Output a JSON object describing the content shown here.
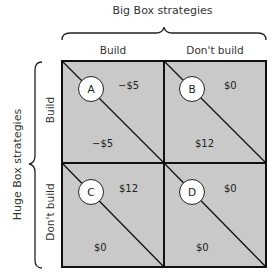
{
  "title_top": "Big Box strategies",
  "title_side": "Huge Box strategies",
  "columns": [
    "Build",
    "Don't build"
  ],
  "rows": [
    "Build",
    "Don't build"
  ],
  "cells": [
    {
      "id": "A",
      "top_right": "−$5",
      "bottom_left": "−$5"
    },
    {
      "id": "B",
      "top_right": "$0",
      "bottom_left": "$12"
    },
    {
      "id": "C",
      "top_right": "$12",
      "bottom_left": "$0"
    },
    {
      "id": "D",
      "top_right": "$0",
      "bottom_left": "$0"
    }
  ],
  "colors": {
    "cell_fill": "#c8c8c8",
    "border": "#111111",
    "node_fill": "#ffffff"
  }
}
